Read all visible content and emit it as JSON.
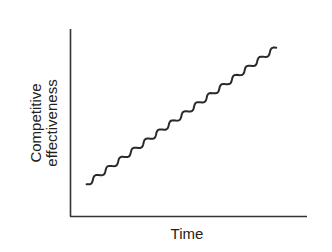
{
  "chart_data": {
    "type": "line",
    "title": "",
    "xlabel": "Time",
    "ylabel_lines": [
      "Competitive",
      "effectiveness"
    ],
    "ylabel": "Competitive effectiveness",
    "grid": false,
    "legend": null,
    "ticks": false,
    "series": [
      {
        "name": "Competitive effectiveness",
        "style": "wavy",
        "description": "Steadily rising line with small periodic wiggles",
        "x": [
          0.07,
          0.2,
          0.33,
          0.46,
          0.6,
          0.73,
          0.86,
          0.87
        ],
        "y": [
          0.17,
          0.3,
          0.42,
          0.53,
          0.64,
          0.76,
          0.87,
          0.9
        ]
      }
    ],
    "xlim": [
      0,
      1
    ],
    "ylim": [
      0,
      1
    ]
  },
  "labels": {
    "y_line1": "Competitive",
    "y_line2": "effectiveness",
    "x": "Time"
  }
}
